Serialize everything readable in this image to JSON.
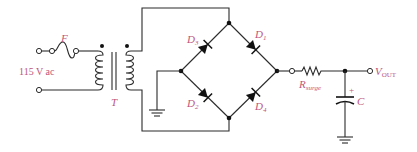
{
  "diagram": {
    "type": "full-wave bridge rectifier with surge resistor and filter capacitor",
    "colors": {
      "wire": "#2b2b2b",
      "label": "#c0557a",
      "background": "#ffffff"
    },
    "labels": {
      "fuse": "F",
      "source": "115 V ac",
      "transformer": "T",
      "d1_main": "D",
      "d1_sub": "1",
      "d2_main": "D",
      "d2_sub": "2",
      "d3_main": "D",
      "d3_sub": "3",
      "d4_main": "D",
      "d4_sub": "4",
      "rsurge_main": "R",
      "rsurge_sub": "surge",
      "cap": "C",
      "cap_polarity": "+",
      "vout_main": "V",
      "vout_sub": "OUT"
    },
    "components": [
      {
        "id": "F",
        "kind": "fuse"
      },
      {
        "id": "T",
        "kind": "transformer"
      },
      {
        "id": "D1",
        "kind": "diode"
      },
      {
        "id": "D2",
        "kind": "diode"
      },
      {
        "id": "D3",
        "kind": "diode"
      },
      {
        "id": "D4",
        "kind": "diode"
      },
      {
        "id": "Rsurge",
        "kind": "resistor"
      },
      {
        "id": "C",
        "kind": "polarized capacitor"
      },
      {
        "id": "GND1",
        "kind": "ground"
      },
      {
        "id": "GND2",
        "kind": "ground"
      }
    ]
  }
}
